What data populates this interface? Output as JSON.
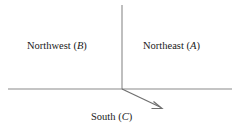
{
  "figure": {
    "background_color": "#ffffff",
    "line_color": "#8a8a8a",
    "text_color": "#1a1a1a"
  },
  "labels": {
    "northwest": {
      "name": "Northwest",
      "symbol": "B",
      "open_paren": "(",
      "close_paren": ")"
    },
    "northeast": {
      "name": "Northeast",
      "symbol": "A",
      "open_paren": "(",
      "close_paren": ")"
    },
    "south": {
      "name": "South",
      "symbol": "C",
      "open_paren": "(",
      "close_paren": ")"
    }
  },
  "diagram_data": {
    "type": "axis-diagram",
    "origin": [
      122,
      89
    ],
    "vertical_axis": {
      "from": [
        122,
        5
      ],
      "to": [
        122,
        89
      ]
    },
    "horizontal_axis": {
      "from": [
        8,
        89
      ],
      "to": [
        232,
        89
      ]
    },
    "arrow": {
      "from": [
        122,
        89
      ],
      "to": [
        162,
        108
      ],
      "head": "open-barbed"
    },
    "regions": [
      "Northwest (B)",
      "Northeast (A)",
      "South (C)"
    ]
  }
}
